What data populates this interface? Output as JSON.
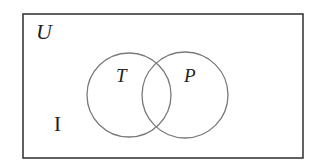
{
  "diagram": {
    "type": "venn",
    "universe": {
      "label": "U",
      "stroke_color": "#3a3a3a"
    },
    "sets": [
      {
        "label": "T",
        "stroke_color": "#7a7a7a"
      },
      {
        "label": "P",
        "stroke_color": "#7a7a7a"
      }
    ],
    "region_labels": [
      {
        "label": "I",
        "region": "outside both sets"
      }
    ]
  }
}
